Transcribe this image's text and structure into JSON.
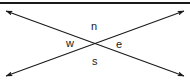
{
  "diagram": {
    "type": "crossing-lines-angle-diagram",
    "background_color": "#ffffff",
    "stroke_color": "#1a1a1a",
    "label_color": "#1a1a1a",
    "top_rule": {
      "name": "top-horizontal-rule",
      "x1": 0,
      "y1": 3,
      "x2": 190,
      "y2": 3,
      "thickness": 2
    },
    "lines": [
      {
        "name": "line-nw-to-se",
        "x1": 6,
        "y1": 11,
        "x2": 184,
        "y2": 76,
        "arrow_start": true,
        "arrow_end": true
      },
      {
        "name": "line-ne-to-sw",
        "x1": 184,
        "y1": 11,
        "x2": 6,
        "y2": 76,
        "arrow_start": true,
        "arrow_end": true
      }
    ],
    "intersection": {
      "x": 95,
      "y": 43
    },
    "labels": [
      {
        "id": "n",
        "text": "n",
        "position": "top",
        "x": 95,
        "y": 26
      },
      {
        "id": "w",
        "text": "w",
        "position": "left",
        "x": 71,
        "y": 43
      },
      {
        "id": "e",
        "text": "e",
        "position": "right",
        "x": 120,
        "y": 44
      },
      {
        "id": "s",
        "text": "s",
        "position": "bottom",
        "x": 96,
        "y": 61
      }
    ]
  }
}
